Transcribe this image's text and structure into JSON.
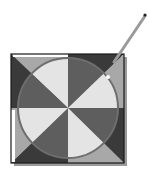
{
  "icon": {
    "name": "radial-gradient-tool-icon",
    "square": {
      "x": 11,
      "y": 54,
      "size": 113
    },
    "center": {
      "x": 68,
      "y": 108
    },
    "circle_radius": 50,
    "pen": {
      "x1": 118,
      "y1": 57,
      "x2": 146,
      "y2": 15
    },
    "highlight": {
      "x": 108,
      "y": 77
    },
    "colors": {
      "outline": "#1a1a1a",
      "shadow": "#8c8c8c",
      "dark_outer": "#3a3a3a",
      "mid_outer": "#a8a8a8",
      "dark_inner": "#5e5e5e",
      "light_inner": "#e4e4e4",
      "circle_stroke": "#6e6e6e",
      "pen": "#9a9a9a",
      "pen_tip": "#222222",
      "white_strip": "#ffffff"
    }
  }
}
